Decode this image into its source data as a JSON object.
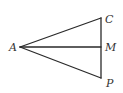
{
  "figure": {
    "type": "geometry",
    "points": {
      "A": {
        "label": "A",
        "x": 20,
        "y": 47
      },
      "C": {
        "label": "C",
        "x": 101,
        "y": 18
      },
      "M": {
        "label": "M",
        "x": 101,
        "y": 47
      },
      "P": {
        "label": "P",
        "x": 101,
        "y": 78
      }
    },
    "segments": [
      {
        "from": "A",
        "to": "C"
      },
      {
        "from": "A",
        "to": "M"
      },
      {
        "from": "A",
        "to": "P"
      },
      {
        "from": "C",
        "to": "P"
      }
    ],
    "colors": {
      "line": "#2a2a2a",
      "label": "#333333",
      "background": "#ffffff"
    }
  }
}
